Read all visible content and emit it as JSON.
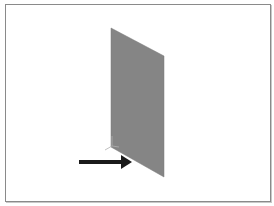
{
  "viewport": {
    "background": "#ffffff",
    "border_color": "#8a8a8a"
  },
  "model": {
    "shape": "plate",
    "fill_color": "#858585",
    "vertices": [
      [
        111,
        28
      ],
      [
        164,
        56
      ],
      [
        164,
        177
      ],
      [
        111,
        147
      ]
    ]
  },
  "annotations": {
    "arrow": {
      "icon": "arrow-right-icon",
      "color": "#1a1a1a",
      "from": [
        79,
        162
      ],
      "to": [
        131,
        162
      ]
    },
    "axis_triad": {
      "icon": "axis-triad-icon",
      "color": "#b0b0b0",
      "origin": [
        112,
        146
      ]
    }
  }
}
